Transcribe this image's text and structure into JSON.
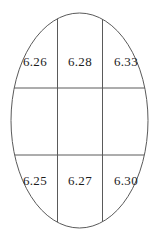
{
  "diagram": {
    "colors": {
      "line": "#5a5a5a",
      "text": "#1c1c1c",
      "background": "#ffffff"
    },
    "cells": {
      "row_top": [
        "6.26",
        "6.28",
        "6.33"
      ],
      "row_middle": [
        "",
        "",
        ""
      ],
      "row_bottom": [
        "6.25",
        "6.27",
        "6.30"
      ]
    }
  }
}
